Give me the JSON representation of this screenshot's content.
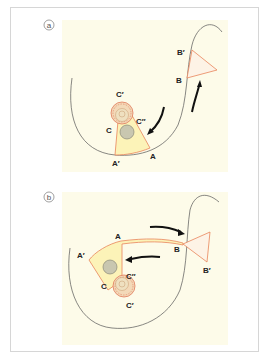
{
  "figure": {
    "panels": [
      {
        "id": "a",
        "label": "a",
        "points": {
          "A": "A",
          "A_prime": "A′",
          "B": "B",
          "B_prime": "B′",
          "C": "C",
          "C_prime": "C′",
          "C_double_prime": "C″"
        }
      },
      {
        "id": "b",
        "label": "b",
        "points": {
          "A": "A",
          "A_prime": "A′",
          "B": "B",
          "B_prime": "B′",
          "C": "C",
          "C_prime": "C′",
          "C_double_prime": "C″"
        }
      }
    ],
    "colors": {
      "panel_background": "#fdfbe9",
      "flap_fill": "#fcf3b8",
      "flap_stroke": "#e8845a",
      "skin_line": "#555555",
      "arrow": "#111111",
      "areola_fill": "#f3d9b8",
      "areola_stroke": "#e07a5a",
      "nipple_fill": "#ece3c6",
      "tumor_fill": "#c9c7b0",
      "frame_border": "#d6d6d6"
    }
  }
}
